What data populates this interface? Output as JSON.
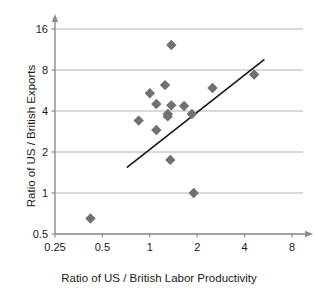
{
  "chart_data": {
    "type": "scatter",
    "title": "",
    "xlabel": "Ratio of US / British Labor Productivity",
    "ylabel": "Ratio of US / British Exports",
    "xscale": "log",
    "yscale": "log",
    "xlim": [
      0.25,
      8
    ],
    "ylim": [
      0.5,
      16
    ],
    "xticks": [
      "0.25",
      "0.5",
      "1",
      "2",
      "4",
      "8"
    ],
    "xtick_values": [
      0.25,
      0.5,
      1,
      2,
      4,
      8
    ],
    "yticks": [
      "0.5",
      "1",
      "2",
      "4",
      "8",
      "16"
    ],
    "ytick_values": [
      0.5,
      1,
      2,
      4,
      8,
      16
    ],
    "grid": "horizontal",
    "legend": "none",
    "marker": "diamond",
    "marker_color": "#707070",
    "points": [
      {
        "x": 0.42,
        "y": 0.65
      },
      {
        "x": 0.85,
        "y": 3.4
      },
      {
        "x": 1.1,
        "y": 2.9
      },
      {
        "x": 1.0,
        "y": 5.4
      },
      {
        "x": 1.1,
        "y": 4.5
      },
      {
        "x": 1.25,
        "y": 6.2
      },
      {
        "x": 1.3,
        "y": 3.8
      },
      {
        "x": 1.3,
        "y": 3.65
      },
      {
        "x": 1.37,
        "y": 12.2
      },
      {
        "x": 1.37,
        "y": 4.4
      },
      {
        "x": 1.35,
        "y": 1.75
      },
      {
        "x": 1.65,
        "y": 4.35
      },
      {
        "x": 1.85,
        "y": 3.8
      },
      {
        "x": 1.9,
        "y": 1.0
      },
      {
        "x": 2.5,
        "y": 5.9
      },
      {
        "x": 4.6,
        "y": 7.4
      }
    ],
    "trendline": {
      "type": "linear-fit",
      "x_start": 0.72,
      "y_start": 1.55,
      "x_end": 5.3,
      "y_end": 9.5,
      "color": "#1a1a1a"
    }
  },
  "axes": {
    "x_title": "Ratio of US / British Labor Productivity",
    "y_title": "Ratio of US / British Exports"
  }
}
